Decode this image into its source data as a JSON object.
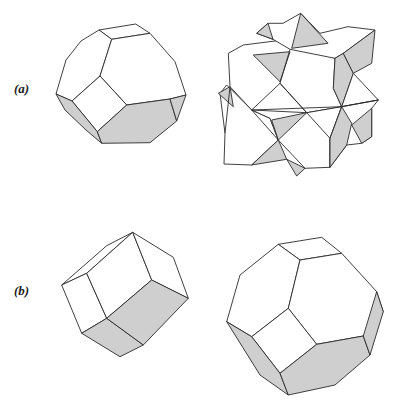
{
  "figure": {
    "labels": {
      "a": "(a)",
      "b": "(b)"
    },
    "colors": {
      "face_light": "#ffffff",
      "face_shaded": "#cfcfcf",
      "edge": "#2a2a2a"
    },
    "shapes": [
      {
        "id": "a-left",
        "description": "truncated octahedron",
        "faces": [
          {
            "shade": "light",
            "points": [
              [
                99,
                30
              ],
              [
                135.7,
                24
              ],
              [
                150,
                33.3
              ],
              [
                111.7,
                39.3
              ]
            ]
          },
          {
            "shade": "light",
            "points": [
              [
                99,
                30
              ],
              [
                111.7,
                39.3
              ],
              [
                100,
                76
              ],
              [
                72,
                101
              ],
              [
                56,
                94
              ],
              [
                66,
                60
              ],
              [
                81,
                41
              ]
            ]
          },
          {
            "shade": "light",
            "points": [
              [
                111.7,
                39.3
              ],
              [
                150,
                33.3
              ],
              [
                175,
                61.7
              ],
              [
                186,
                95
              ],
              [
                170,
                99
              ],
              [
                126.7,
                105
              ],
              [
                100,
                76
              ]
            ]
          },
          {
            "shade": "light",
            "points": [
              [
                100,
                76
              ],
              [
                126.7,
                105
              ],
              [
                97.3,
                131.7
              ],
              [
                72,
                101
              ]
            ]
          },
          {
            "shade": "shaded",
            "points": [
              [
                56,
                94
              ],
              [
                72,
                101
              ],
              [
                97.3,
                131.7
              ],
              [
                101.7,
                143.3
              ],
              [
                86,
                130
              ],
              [
                65,
                110
              ]
            ]
          },
          {
            "shade": "shaded",
            "points": [
              [
                126.7,
                105
              ],
              [
                170,
                99
              ],
              [
                176.7,
                121
              ],
              [
                150,
                142.7
              ],
              [
                101.7,
                143.3
              ],
              [
                97.3,
                131.7
              ]
            ]
          },
          {
            "shade": "shaded",
            "points": [
              [
                186,
                95
              ],
              [
                176.7,
                121
              ],
              [
                170,
                99
              ]
            ]
          }
        ]
      },
      {
        "id": "a-right",
        "description": "stellated compound solid",
        "faces": [
          {
            "shade": "light",
            "points": [
              [
                228.3,
                53.3
              ],
              [
                243.3,
                45
              ],
              [
                283,
                40
              ],
              [
                335,
                58.3
              ],
              [
                333.3,
                88.3
              ],
              [
                341.7,
                106.7
              ],
              [
                306.7,
                112.7
              ],
              [
                280,
                83.3
              ],
              [
                251.7,
                110
              ],
              [
                230,
                86.7
              ]
            ]
          },
          {
            "shade": "light",
            "points": [
              [
                268,
                23.3
              ],
              [
                283,
                23.3
              ],
              [
                300.7,
                13.3
              ],
              [
                320,
                33.3
              ],
              [
                348,
                26.7
              ],
              [
                375,
                30
              ],
              [
                343.3,
                53.3
              ],
              [
                335,
                58.3
              ],
              [
                290,
                49.3
              ],
              [
                273,
                39.3
              ],
              [
                256.7,
                33.3
              ]
            ]
          },
          {
            "shade": "shaded",
            "points": [
              [
                300.7,
                13.3
              ],
              [
                328,
                43.3
              ],
              [
                291.7,
                48.3
              ]
            ]
          },
          {
            "shade": "shaded",
            "points": [
              [
                256.7,
                33.3
              ],
              [
                268,
                23.3
              ],
              [
                273,
                39.3
              ]
            ]
          },
          {
            "shade": "shaded",
            "points": [
              [
                253.3,
                55
              ],
              [
                290,
                51.7
              ],
              [
                280,
                81.7
              ]
            ]
          },
          {
            "shade": "shaded",
            "points": [
              [
                335,
                58.3
              ],
              [
                343.3,
                53.3
              ],
              [
                353.3,
                73.3
              ],
              [
                341.7,
                106.7
              ],
              [
                333.3,
                88.3
              ]
            ]
          },
          {
            "shade": "shaded",
            "points": [
              [
                375,
                30
              ],
              [
                371.7,
                63.3
              ],
              [
                353.3,
                73.3
              ],
              [
                343.3,
                53.3
              ]
            ]
          },
          {
            "shade": "light",
            "points": [
              [
                353.3,
                73.3
              ],
              [
                378.3,
                100
              ],
              [
                341.7,
                106.7
              ]
            ]
          },
          {
            "shade": "light",
            "points": [
              [
                226.7,
                85
              ],
              [
                251.7,
                110
              ],
              [
                270,
                118.3
              ],
              [
                278.3,
                140
              ],
              [
                251.7,
                165
              ],
              [
                224,
                164
              ],
              [
                225,
                133.3
              ],
              [
                220,
                93.3
              ]
            ]
          },
          {
            "shade": "shaded",
            "points": [
              [
                218.3,
                93.3
              ],
              [
                230,
                86.7
              ],
              [
                233.3,
                106.7
              ]
            ]
          },
          {
            "shade": "light",
            "points": [
              [
                251.7,
                110
              ],
              [
                306.7,
                112.7
              ],
              [
                341.7,
                106.7
              ],
              [
                330,
                138.3
              ],
              [
                330,
                167.3
              ],
              [
                305,
                168.3
              ],
              [
                278.3,
                140
              ],
              [
                270,
                118.3
              ]
            ]
          },
          {
            "shade": "shaded",
            "points": [
              [
                271.7,
                120
              ],
              [
                306.7,
                112.7
              ],
              [
                278.3,
                140
              ]
            ]
          },
          {
            "shade": "shaded",
            "points": [
              [
                278.3,
                140
              ],
              [
                286.7,
                159.3
              ],
              [
                251.7,
                165
              ]
            ]
          },
          {
            "shade": "shaded",
            "points": [
              [
                286.7,
                159.3
              ],
              [
                305,
                168.3
              ],
              [
                296.7,
                176
              ]
            ]
          },
          {
            "shade": "light",
            "points": [
              [
                341.7,
                106.7
              ],
              [
                378.3,
                100
              ],
              [
                371.7,
                108.3
              ],
              [
                371.7,
                136.7
              ],
              [
                361.7,
                143.3
              ],
              [
                346.7,
                145
              ],
              [
                330,
                167.3
              ],
              [
                330,
                138.3
              ]
            ]
          },
          {
            "shade": "shaded",
            "points": [
              [
                341.7,
                106.7
              ],
              [
                351.7,
                123.3
              ],
              [
                346.7,
                145
              ],
              [
                330,
                167.3
              ],
              [
                330,
                138.3
              ]
            ]
          },
          {
            "shade": "shaded",
            "points": [
              [
                371.7,
                108.3
              ],
              [
                371.7,
                136.7
              ],
              [
                361.7,
                143.3
              ],
              [
                351.7,
                125
              ]
            ]
          }
        ],
        "lines": [
          [
            [
              280,
              83.3
            ],
            [
              306.7,
              112.7
            ]
          ],
          [
            [
              290,
              49.3
            ],
            [
              280,
              83.3
            ]
          ],
          [
            [
              251.7,
              110
            ],
            [
              278.3,
              140
            ]
          ],
          [
            [
              306.7,
              112.7
            ],
            [
              330,
              138.3
            ]
          ],
          [
            [
              341.7,
              106.7
            ],
            [
              378.3,
              100
            ]
          ],
          [
            [
              251.7,
              110
            ],
            [
              341.7,
              106.7
            ]
          ],
          [
            [
              230,
              86.7
            ],
            [
              225,
              133.3
            ]
          ]
        ]
      },
      {
        "id": "b-left",
        "description": "elongated rhombic dodecahedron",
        "faces": [
          {
            "shade": "light",
            "points": [
              [
                61.7,
                285
              ],
              [
                106.7,
                245.7
              ],
              [
                132.7,
                232.3
              ],
              [
                86.7,
                273.3
              ]
            ]
          },
          {
            "shade": "light",
            "points": [
              [
                61.7,
                285
              ],
              [
                86.7,
                273.3
              ],
              [
                106.7,
                318.3
              ],
              [
                81.7,
                333.3
              ]
            ]
          },
          {
            "shade": "light",
            "points": [
              [
                86.7,
                273.3
              ],
              [
                132.7,
                232.3
              ],
              [
                151.7,
                280
              ],
              [
                106.7,
                318.3
              ]
            ]
          },
          {
            "shade": "light",
            "points": [
              [
                132.7,
                232.3
              ],
              [
                173.3,
                257.3
              ],
              [
                188.3,
                298.3
              ],
              [
                151.7,
                280
              ]
            ]
          },
          {
            "shade": "shaded",
            "points": [
              [
                81.7,
                333.3
              ],
              [
                106.7,
                318.3
              ],
              [
                143.3,
                345
              ],
              [
                120,
                356.7
              ]
            ]
          },
          {
            "shade": "shaded",
            "points": [
              [
                106.7,
                318.3
              ],
              [
                151.7,
                280
              ],
              [
                188.3,
                298.3
              ],
              [
                143.3,
                345
              ]
            ]
          }
        ]
      },
      {
        "id": "b-right",
        "description": "truncated octahedron",
        "faces": [
          {
            "shade": "light",
            "points": [
              [
                278.3,
                244.3
              ],
              [
                321.7,
                237.3
              ],
              [
                341.7,
                253.3
              ],
              [
                300,
                260
              ]
            ]
          },
          {
            "shade": "light",
            "points": [
              [
                278.3,
                244.3
              ],
              [
                300,
                260
              ],
              [
                288.3,
                308.3
              ],
              [
                251.7,
                336.7
              ],
              [
                226.7,
                321.7
              ],
              [
                240,
                275
              ]
            ]
          },
          {
            "shade": "light",
            "points": [
              [
                300,
                260
              ],
              [
                341.7,
                253.3
              ],
              [
                376.7,
                291.7
              ],
              [
                383.3,
                311.7
              ],
              [
                363.3,
                336
              ],
              [
                316.7,
                344.3
              ],
              [
                288.3,
                308.3
              ]
            ]
          },
          {
            "shade": "light",
            "points": [
              [
                288.3,
                308.3
              ],
              [
                316.7,
                344.3
              ],
              [
                280,
                373.3
              ],
              [
                251.7,
                336.7
              ]
            ]
          },
          {
            "shade": "shaded",
            "points": [
              [
                226.7,
                321.7
              ],
              [
                251.7,
                336.7
              ],
              [
                280,
                373.3
              ],
              [
                288.3,
                395
              ],
              [
                260,
                375
              ]
            ]
          },
          {
            "shade": "shaded",
            "points": [
              [
                280,
                373.3
              ],
              [
                316.7,
                344.3
              ],
              [
                363.3,
                336
              ],
              [
                370,
                355
              ],
              [
                335,
                385
              ],
              [
                288.3,
                395
              ]
            ]
          },
          {
            "shade": "shaded",
            "points": [
              [
                376.7,
                291.7
              ],
              [
                383.3,
                311.7
              ],
              [
                370,
                355
              ],
              [
                363.3,
                336
              ]
            ]
          }
        ]
      }
    ]
  }
}
